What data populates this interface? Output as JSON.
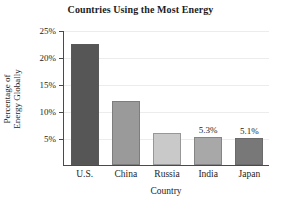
{
  "chart_data": {
    "type": "bar",
    "title": "Countries Using the Most Energy",
    "xlabel": "Country",
    "ylabel_line1": "Percentage of",
    "ylabel_line2": "Energy Globally",
    "categories": [
      "U.S.",
      "China",
      "Russia",
      "India",
      "Japan"
    ],
    "values": [
      22.5,
      12.0,
      6.0,
      5.3,
      5.1
    ],
    "value_labels": [
      "",
      "",
      "",
      "5.3%",
      "5.1%"
    ],
    "bar_colors": [
      "#565656",
      "#9a9a9a",
      "#c9c9c9",
      "#a8a8a8",
      "#787878"
    ],
    "ylim": [
      0,
      25
    ],
    "yticks": [
      5,
      10,
      15,
      20,
      25
    ],
    "ytick_labels": [
      "5%",
      "10%",
      "15%",
      "20%",
      "25%"
    ],
    "grid": true,
    "legend": "none",
    "axis_color": "#4a4a4a",
    "grid_color": "#ececec",
    "background": "#ffffff"
  }
}
